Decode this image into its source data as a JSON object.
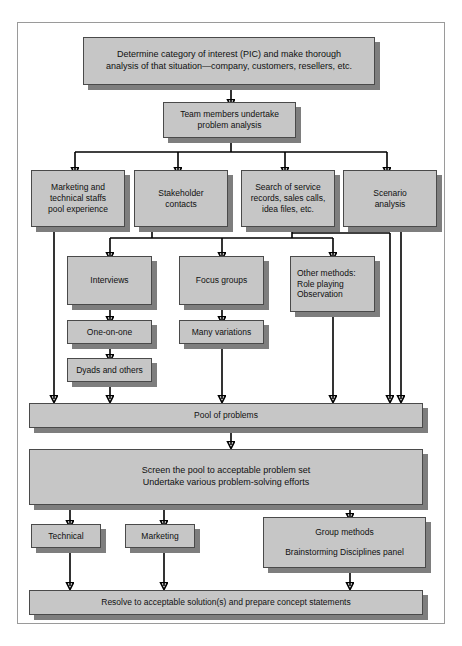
{
  "header": {
    "left": "",
    "right": ""
  },
  "diagram": {
    "type": "flowchart",
    "box_fill": "#c6c6c6",
    "box_border": "#4a4a4a",
    "shadow_color": "#7e7e7e",
    "frame_border": "#9a9a9a",
    "nodes": [
      {
        "id": "determine",
        "lines": [
          "Determine category of interest (PIC) and make thorough",
          "analysis of that situation—company, customers, resellers, etc."
        ]
      },
      {
        "id": "team",
        "lines": [
          "Team members undertake",
          "problem analysis"
        ]
      },
      {
        "id": "marketing_staff",
        "lines": [
          "Marketing and",
          "technical staffs",
          "pool experience"
        ]
      },
      {
        "id": "stakeholder",
        "lines": [
          "Stakeholder",
          "contacts"
        ]
      },
      {
        "id": "search_service",
        "lines": [
          "Search of service",
          "records, sales calls,",
          "idea files, etc."
        ]
      },
      {
        "id": "scenario",
        "lines": [
          "Scenario",
          "analysis"
        ]
      },
      {
        "id": "interviews",
        "lines": [
          "Interviews"
        ]
      },
      {
        "id": "focus_groups",
        "lines": [
          "Focus groups"
        ]
      },
      {
        "id": "other_methods",
        "lines": [
          "Other methods:",
          "Role playing",
          "Observation"
        ]
      },
      {
        "id": "one_on_one",
        "lines": [
          "One-on-one"
        ]
      },
      {
        "id": "many_variations",
        "lines": [
          "Many variations"
        ]
      },
      {
        "id": "dyads",
        "lines": [
          "Dyads and others"
        ]
      },
      {
        "id": "pool",
        "lines": [
          "Pool of problems"
        ]
      },
      {
        "id": "screen",
        "lines": [
          "Screen the pool to acceptable problem set",
          "Undertake various problem-solving efforts"
        ]
      },
      {
        "id": "technical",
        "lines": [
          "Technical"
        ]
      },
      {
        "id": "marketing",
        "lines": [
          "Marketing"
        ]
      },
      {
        "id": "group_methods",
        "lines": [
          "Group methods",
          "",
          "Brainstorming   Disciplines panel"
        ]
      },
      {
        "id": "resolve",
        "lines": [
          "Resolve to acceptable solution(s) and prepare concept statements"
        ]
      }
    ]
  }
}
